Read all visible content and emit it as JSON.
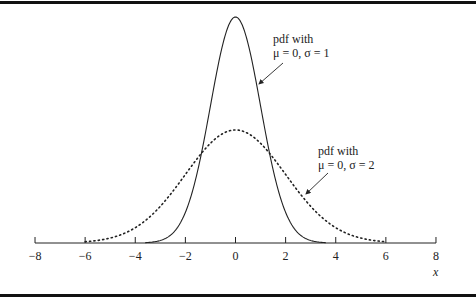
{
  "chart_data": {
    "type": "line",
    "title": "",
    "xlabel": "x",
    "ylabel": "",
    "xlim": [
      -8,
      8
    ],
    "x_ticks": [
      -8,
      -6,
      -4,
      -2,
      0,
      2,
      4,
      6,
      8
    ],
    "x_tick_labels": [
      "−8",
      "−6",
      "−4",
      "−2",
      "0",
      "2",
      "4",
      "6",
      "8"
    ],
    "grid": false,
    "legend": null,
    "series": [
      {
        "name": "pdf with μ = 0, σ = 1",
        "style": "solid",
        "mu": 0,
        "sigma": 1,
        "x": [
          -3.5,
          -3,
          -2.5,
          -2,
          -1.5,
          -1,
          -0.5,
          0,
          0.5,
          1,
          1.5,
          2,
          2.5,
          3,
          3.5
        ],
        "values": [
          0.0009,
          0.0044,
          0.0175,
          0.054,
          0.1295,
          0.242,
          0.3521,
          0.3989,
          0.3521,
          0.242,
          0.1295,
          0.054,
          0.0175,
          0.0044,
          0.0009
        ]
      },
      {
        "name": "pdf with μ = 0, σ = 2",
        "style": "dotted",
        "mu": 0,
        "sigma": 2,
        "x": [
          -6,
          -5,
          -4,
          -3,
          -2,
          -1,
          0,
          1,
          2,
          3,
          4,
          5,
          6
        ],
        "values": [
          0.0022,
          0.0088,
          0.027,
          0.0648,
          0.121,
          0.176,
          0.1995,
          0.176,
          0.121,
          0.0648,
          0.027,
          0.0088,
          0.0022
        ]
      }
    ],
    "annotations": [
      {
        "line1": "pdf with",
        "line2": "μ = 0, σ = 1",
        "points_to": "solid curve"
      },
      {
        "line1": "pdf with",
        "line2": "μ = 0, σ = 2",
        "points_to": "dotted curve"
      }
    ]
  },
  "axis": {
    "ticks": [
      "−8",
      "−6",
      "−4",
      "−2",
      "0",
      "2",
      "4",
      "6",
      "8"
    ],
    "xlabel": "x"
  },
  "annotations": {
    "a1": {
      "line1": "pdf with",
      "line2": "μ = 0, σ = 1"
    },
    "a2": {
      "line1": "pdf with",
      "line2": "μ = 0, σ = 2"
    }
  }
}
